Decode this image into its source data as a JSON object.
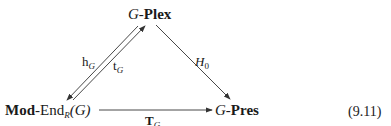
{
  "diagram": {
    "type": "commutative-triangle",
    "nodes": {
      "top": {
        "prefix": "G",
        "sep": "-",
        "name": "Plex"
      },
      "bottom_left": {
        "name": "Mod",
        "sep": "-",
        "func": "End",
        "func_sub": "R",
        "arg": "(G)"
      },
      "bottom_right": {
        "prefix": "G",
        "sep": "-",
        "name": "Pres"
      }
    },
    "arrows": [
      {
        "id": "hG",
        "from": "top",
        "to": "bottom_left",
        "label_main": "h",
        "label_sub": "G"
      },
      {
        "id": "tG",
        "from": "bottom_left",
        "to": "top",
        "label_main": "t",
        "label_sub": "G"
      },
      {
        "id": "H0",
        "from": "top",
        "to": "bottom_right",
        "label_main": "H",
        "label_sub": "0"
      },
      {
        "id": "TG",
        "from": "bottom_left",
        "to": "bottom_right",
        "label_main": "T",
        "label_sub": "G"
      }
    ],
    "equation_number": "(9.11)"
  }
}
